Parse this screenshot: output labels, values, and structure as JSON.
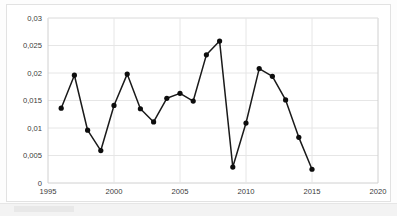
{
  "chart_data": {
    "type": "line",
    "title": "",
    "xlabel": "",
    "ylabel": "",
    "x": [
      1996,
      1997,
      1998,
      1999,
      2000,
      2001,
      2002,
      2003,
      2004,
      2005,
      2006,
      2007,
      2008,
      2009,
      2010,
      2011,
      2012,
      2013,
      2014,
      2015
    ],
    "values": [
      0.0136,
      0.0196,
      0.0096,
      0.0059,
      0.0141,
      0.0198,
      0.0135,
      0.0111,
      0.0154,
      0.0163,
      0.0149,
      0.0233,
      0.0258,
      0.0029,
      0.0109,
      0.0208,
      0.0194,
      0.0151,
      0.0083,
      0.0025
    ],
    "series": [
      {
        "name": "series-1",
        "values": [
          0.0136,
          0.0196,
          0.0096,
          0.0059,
          0.0141,
          0.0198,
          0.0135,
          0.0111,
          0.0154,
          0.0163,
          0.0149,
          0.0233,
          0.0258,
          0.0029,
          0.0109,
          0.0208,
          0.0194,
          0.0151,
          0.0083,
          0.0025
        ]
      }
    ],
    "xlim": [
      1995,
      2020
    ],
    "ylim": [
      0,
      0.03
    ],
    "x_ticks": [
      1995,
      2000,
      2005,
      2010,
      2015,
      2020
    ],
    "x_tick_labels": [
      "1995",
      "2000",
      "2005",
      "2010",
      "2015",
      "2020"
    ],
    "y_ticks": [
      0,
      0.005,
      0.01,
      0.015,
      0.02,
      0.025,
      0.03
    ],
    "y_tick_labels": [
      "0",
      "0,005",
      "0,01",
      "0,015",
      "0,02",
      "0,025",
      "0,03"
    ],
    "grid": true,
    "grid_horizontal": true,
    "grid_vertical": true,
    "legend": false,
    "legend_position": "none",
    "marker": "circle",
    "marker_color": "#0d0d0d",
    "line_color": "#1a1a1a",
    "grid_color": "#e6e6e6",
    "axis_color": "#d0d0d0",
    "plot_background": "#ffffff",
    "decimal_separator": ","
  }
}
